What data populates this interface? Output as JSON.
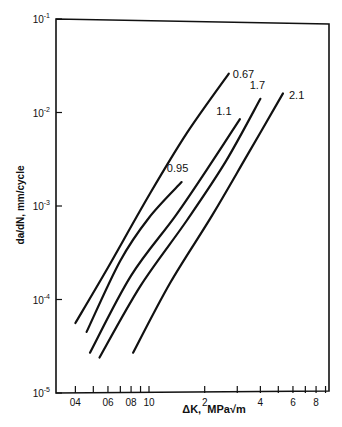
{
  "chart_data": {
    "type": "line",
    "title": "",
    "xlabel": "ΔK, MPa√m",
    "ylabel": "da/dN, mm/cycle",
    "xscale": "log",
    "yscale": "log",
    "xlim": [
      0.33,
      9.5
    ],
    "ylim": [
      1e-05,
      0.1
    ],
    "grid": false,
    "legend_position": "inline labels at curve ends",
    "x_ticks": [
      {
        "value": 0.4,
        "label": "04"
      },
      {
        "value": 0.5,
        "label": ""
      },
      {
        "value": 0.6,
        "label": "06"
      },
      {
        "value": 0.7,
        "label": ""
      },
      {
        "value": 0.8,
        "label": "08"
      },
      {
        "value": 0.9,
        "label": ""
      },
      {
        "value": 1.0,
        "label": "10"
      },
      {
        "value": 2,
        "label": "2"
      },
      {
        "value": 3,
        "label": ""
      },
      {
        "value": 4,
        "label": "4"
      },
      {
        "value": 5,
        "label": ""
      },
      {
        "value": 6,
        "label": "6"
      },
      {
        "value": 7,
        "label": ""
      },
      {
        "value": 8,
        "label": "8"
      },
      {
        "value": 9,
        "label": ""
      }
    ],
    "y_ticks": [
      {
        "value": 0.1,
        "label": "10",
        "exp": "-1"
      },
      {
        "value": 0.01,
        "label": "10",
        "exp": "-2"
      },
      {
        "value": 0.001,
        "label": "10",
        "exp": "-3"
      },
      {
        "value": 0.0001,
        "label": "10",
        "exp": "-4"
      },
      {
        "value": 1e-05,
        "label": "10",
        "exp": "-5"
      }
    ],
    "series": [
      {
        "name": "0.67",
        "x": [
          0.4,
          0.6,
          1.0,
          1.6,
          2.7
        ],
        "y": [
          5.6e-05,
          0.00022,
          0.0013,
          0.006,
          0.026
        ]
      },
      {
        "name": "0.95",
        "x": [
          0.46,
          0.7,
          1.0,
          1.5
        ],
        "y": [
          4.5e-05,
          0.00026,
          0.00075,
          0.0018
        ]
      },
      {
        "name": "1.1",
        "x": [
          0.48,
          0.8,
          1.4,
          2.2,
          3.1
        ],
        "y": [
          2.7e-05,
          0.00018,
          0.0008,
          0.003,
          0.0085
        ]
      },
      {
        "name": "1.7",
        "x": [
          0.54,
          0.9,
          1.6,
          2.6,
          4.0
        ],
        "y": [
          2.4e-05,
          0.00014,
          0.0007,
          0.003,
          0.014
        ]
      },
      {
        "name": "2.1",
        "x": [
          0.82,
          1.3,
          2.2,
          3.4,
          5.3
        ],
        "y": [
          2.7e-05,
          0.00015,
          0.0008,
          0.0035,
          0.016
        ]
      }
    ],
    "annotations": [
      "0.67",
      "0.95",
      "1.1",
      "1.7",
      "2.1"
    ]
  },
  "axes": {
    "xlabel": "ΔK,  MPa√m",
    "ylabel": "da/dN, mm/cycle"
  }
}
